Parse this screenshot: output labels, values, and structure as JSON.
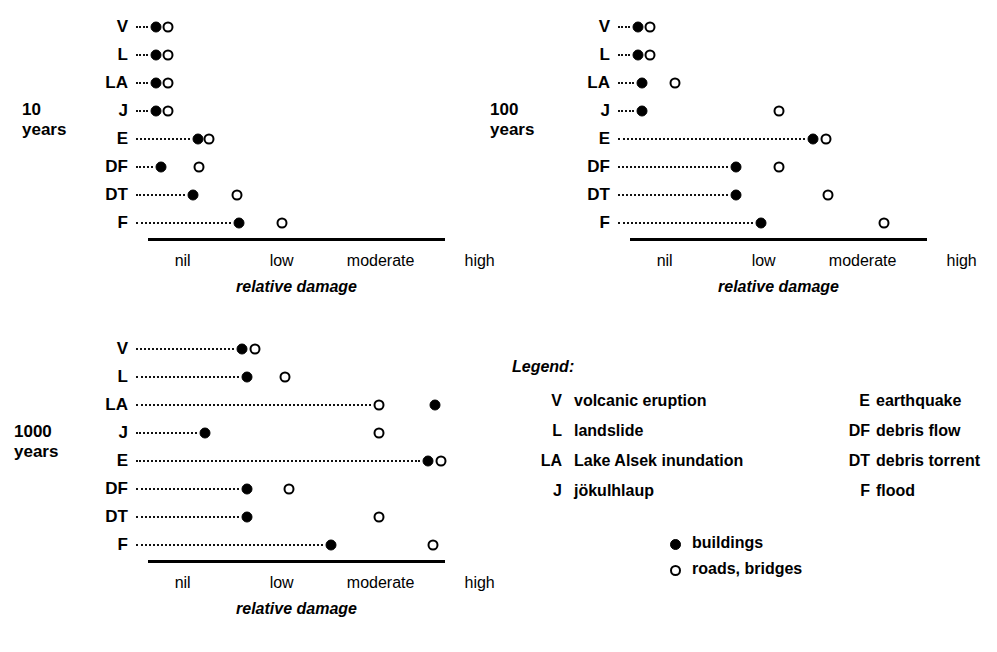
{
  "figure": {
    "axis_tick_labels": [
      "nil",
      "low",
      "moderate",
      "high"
    ],
    "axis_title": "relative damage",
    "scale_min": 0,
    "scale_max": 3
  },
  "charts": [
    {
      "id": "chart-10-years",
      "period_label": "10\nyears",
      "period_value": "10",
      "period_unit": "years",
      "rows": [
        {
          "code": "V",
          "buildings": 0.08,
          "roads": 0.2
        },
        {
          "code": "L",
          "buildings": 0.08,
          "roads": 0.2
        },
        {
          "code": "LA",
          "buildings": 0.08,
          "roads": 0.2
        },
        {
          "code": "J",
          "buildings": 0.08,
          "roads": 0.2
        },
        {
          "code": "E",
          "buildings": 0.5,
          "roads": 0.62
        },
        {
          "code": "DF",
          "buildings": 0.13,
          "roads": 0.52
        },
        {
          "code": "DT",
          "buildings": 0.45,
          "roads": 0.9
        },
        {
          "code": "F",
          "buildings": 0.92,
          "roads": 1.35
        }
      ]
    },
    {
      "id": "chart-100-years",
      "period_label": "100\nyears",
      "period_value": "100",
      "period_unit": "years",
      "rows": [
        {
          "code": "V",
          "buildings": 0.08,
          "roads": 0.2
        },
        {
          "code": "L",
          "buildings": 0.08,
          "roads": 0.2
        },
        {
          "code": "LA",
          "buildings": 0.12,
          "roads": 0.45
        },
        {
          "code": "J",
          "buildings": 0.12,
          "roads": 1.5
        },
        {
          "code": "E",
          "buildings": 1.85,
          "roads": 1.98
        },
        {
          "code": "DF",
          "buildings": 1.07,
          "roads": 1.5
        },
        {
          "code": "DT",
          "buildings": 1.07,
          "roads": 2.0
        },
        {
          "code": "F",
          "buildings": 1.32,
          "roads": 2.57
        }
      ]
    },
    {
      "id": "chart-1000-years",
      "period_label": "1000\nyears",
      "period_value": "1000",
      "period_unit": "years",
      "rows": [
        {
          "code": "V",
          "buildings": 0.95,
          "roads": 1.08
        },
        {
          "code": "L",
          "buildings": 1.0,
          "roads": 1.38
        },
        {
          "code": "LA",
          "buildings": 2.9,
          "roads": 2.33
        },
        {
          "code": "J",
          "buildings": 0.58,
          "roads": 2.33
        },
        {
          "code": "E",
          "buildings": 2.83,
          "roads": 2.96
        },
        {
          "code": "DF",
          "buildings": 1.0,
          "roads": 1.42
        },
        {
          "code": "DT",
          "buildings": 1.0,
          "roads": 2.33
        },
        {
          "code": "F",
          "buildings": 1.85,
          "roads": 2.88
        }
      ]
    }
  ],
  "legend": {
    "title": "Legend:",
    "entries_left": [
      {
        "abbr": "V",
        "desc": "volcanic eruption"
      },
      {
        "abbr": "L",
        "desc": "landslide"
      },
      {
        "abbr": "LA",
        "desc": "Lake Alsek inundation"
      },
      {
        "abbr": "J",
        "desc": "jökulhlaup"
      }
    ],
    "entries_right": [
      {
        "abbr": "E",
        "desc": "earthquake"
      },
      {
        "abbr": "DF",
        "desc": "debris flow"
      },
      {
        "abbr": "DT",
        "desc": "debris torrent"
      },
      {
        "abbr": "F",
        "desc": "flood"
      }
    ],
    "symbols": [
      {
        "icon": "filled-circle-icon",
        "label": "buildings"
      },
      {
        "icon": "open-circle-icon",
        "label": "roads, bridges"
      }
    ]
  },
  "colors": {
    "ink": "#000000",
    "paper": "#ffffff"
  }
}
